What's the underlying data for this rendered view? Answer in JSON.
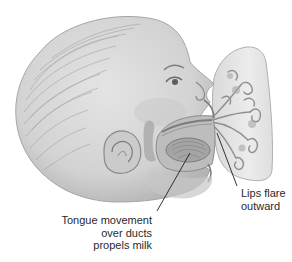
{
  "figure": {
    "colors": {
      "skin": "#dcdcdc",
      "skin_shade": "#b9b9b9",
      "outline": "#8a8a8a",
      "hair": "#9c9c9c",
      "ducts": "#8f8f8f",
      "breast": "#e6e6e6",
      "leader_line": "#1e1e1e",
      "text": "#2a2a2a"
    }
  },
  "annotations": {
    "tongue": {
      "lines": [
        "Tongue movement",
        "over ducts",
        "propels milk"
      ]
    },
    "lips": {
      "lines": [
        "Lips flare",
        "outward"
      ]
    }
  }
}
